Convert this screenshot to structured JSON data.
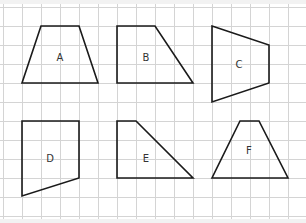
{
  "diagram": {
    "grid": {
      "origin_x": 3,
      "origin_y": 7,
      "cell": 19,
      "cols": 16,
      "rows": 11,
      "line_color": "#d4d4d4",
      "bg": "#ffffff"
    },
    "background": "#f2f2f2",
    "stroke_color": "#1a1a1a",
    "label_color": "#333333",
    "shapes": [
      {
        "label": "A",
        "points": [
          [
            41,
            26
          ],
          [
            79,
            26
          ],
          [
            98,
            83
          ],
          [
            22,
            83
          ]
        ],
        "label_pos": [
          60,
          57
        ]
      },
      {
        "label": "B",
        "points": [
          [
            117,
            26
          ],
          [
            155,
            26
          ],
          [
            193,
            83
          ],
          [
            117,
            83
          ]
        ],
        "label_pos": [
          146,
          57
        ]
      },
      {
        "label": "C",
        "points": [
          [
            212,
            26
          ],
          [
            269,
            45
          ],
          [
            269,
            83
          ],
          [
            212,
            102
          ]
        ],
        "label_pos": [
          239,
          64
        ]
      },
      {
        "label": "D",
        "points": [
          [
            22,
            121
          ],
          [
            79,
            121
          ],
          [
            79,
            178
          ],
          [
            22,
            196
          ]
        ],
        "label_pos": [
          50,
          158
        ]
      },
      {
        "label": "E",
        "points": [
          [
            117,
            121
          ],
          [
            136,
            121
          ],
          [
            193,
            178
          ],
          [
            117,
            178
          ]
        ],
        "label_pos": [
          146,
          158
        ]
      },
      {
        "label": "F",
        "points": [
          [
            240,
            121
          ],
          [
            259,
            121
          ],
          [
            288,
            178
          ],
          [
            212,
            178
          ]
        ],
        "label_pos": [
          249,
          150
        ]
      }
    ]
  }
}
